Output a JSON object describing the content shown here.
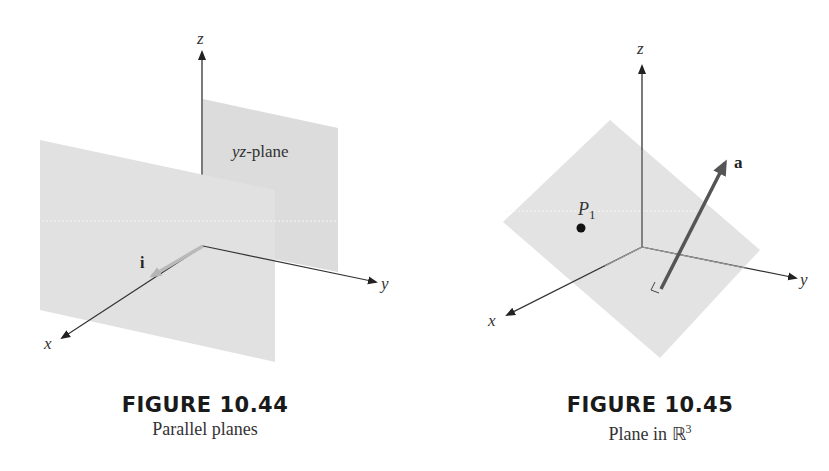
{
  "figures": [
    {
      "id": "10.44",
      "caption_title": "FIGURE 10.44",
      "caption_subtitle": "Parallel planes",
      "labels": {
        "z_axis": "z",
        "y_axis": "y",
        "x_axis": "x",
        "plane_label_y": "yz",
        "plane_label_rest": "-plane",
        "vector": "i"
      }
    },
    {
      "id": "10.45",
      "caption_title": "FIGURE 10.45",
      "caption_subtitle_text": "Plane in ",
      "caption_subtitle_symbol": "ℝ",
      "caption_subtitle_sup": "3",
      "labels": {
        "z_axis": "z",
        "y_axis": "y",
        "x_axis": "x",
        "point_letter": "P",
        "point_subscript": "1",
        "vector": "a"
      }
    }
  ],
  "colors": {
    "plane_fill": "#e3e3e3",
    "plane_back_fill": "#dcdcdc",
    "axis": "#333333",
    "vector_i": "#b9b9b9",
    "vector_a": "#555555",
    "dotted": "#ffffff"
  }
}
